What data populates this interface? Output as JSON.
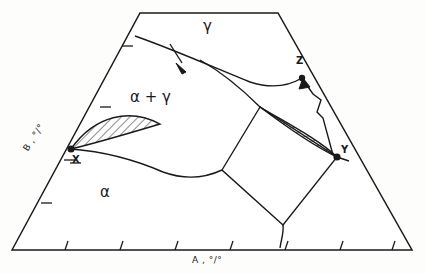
{
  "figure": {
    "kind": "ternary-isothermal-section-phase-diagram",
    "line_color": "#1a1a1a",
    "fill_color": "#ffffff",
    "background": "#fdfdfc"
  },
  "axes": {
    "bottom": {
      "label": "A , °/°",
      "name": "A",
      "unit": "%",
      "tick_count": 7
    },
    "left": {
      "label": "B , °/°",
      "name": "B",
      "unit": "%",
      "tick_count": 3
    }
  },
  "regions": [
    {
      "id": "gamma",
      "label": "γ",
      "x": 203,
      "y": 26
    },
    {
      "id": "alpha-plus-gamma",
      "label": "α + γ",
      "x": 138,
      "y": 97
    },
    {
      "id": "alpha",
      "label": "α",
      "x": 103,
      "y": 192
    }
  ],
  "points": [
    {
      "id": "X",
      "label": "X",
      "x": 71,
      "y": 149,
      "label_x": 72,
      "label_y": 155
    },
    {
      "id": "Y",
      "label": "Y",
      "x": 337,
      "y": 157,
      "label_x": 340,
      "label_y": 146
    },
    {
      "id": "Z",
      "label": "Z",
      "x": 302,
      "y": 78,
      "label_x": 296,
      "label_y": 58
    }
  ],
  "annotations": [
    {
      "id": "boundary-arrow",
      "kind": "arrow",
      "from_x": 168,
      "from_y": 50,
      "to_x": 186,
      "to_y": 71
    },
    {
      "id": "zigzag-arrow-Y-to-Z",
      "kind": "zigzag-arrow",
      "from_x": 333,
      "from_y": 155,
      "to_x": 304,
      "to_y": 82
    }
  ],
  "hatched_areas": [
    {
      "id": "left-two-phase-lens",
      "hatch_angle_deg": 45
    },
    {
      "id": "right-two-phase-lens",
      "hatch_angle_deg": 80
    }
  ]
}
